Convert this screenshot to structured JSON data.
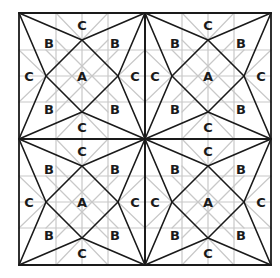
{
  "diagram": {
    "origin": [
      19,
      13
    ],
    "quadrant_size": 126,
    "grid": [
      2,
      2
    ],
    "inset": 27,
    "gray_offsets": [
      37,
      63,
      89
    ],
    "colors": {
      "background": "#ffffff",
      "black_line": "#1a1a1a",
      "gray_line": "#c8c8c8",
      "label": "#1a1a1a"
    },
    "quadrant_labels": [
      {
        "text": "A",
        "pos": [
          63,
          63
        ]
      },
      {
        "text": "B",
        "pos": [
          30,
          30
        ]
      },
      {
        "text": "B",
        "pos": [
          96,
          30
        ]
      },
      {
        "text": "B",
        "pos": [
          30,
          96
        ]
      },
      {
        "text": "B",
        "pos": [
          96,
          96
        ]
      },
      {
        "text": "C",
        "pos": [
          63,
          12
        ]
      },
      {
        "text": "C",
        "pos": [
          63,
          114
        ]
      },
      {
        "text": "C",
        "pos": [
          10,
          63
        ]
      },
      {
        "text": "C",
        "pos": [
          116,
          63
        ]
      }
    ]
  }
}
